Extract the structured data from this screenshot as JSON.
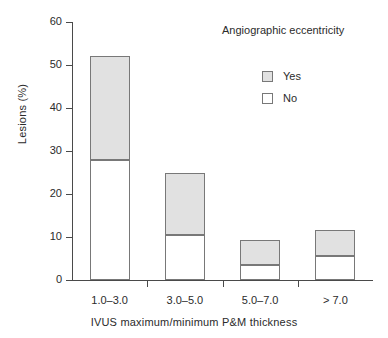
{
  "chart_data": {
    "type": "bar",
    "subtype": "stacked-vertical",
    "title": "",
    "xlabel": "IVUS maximum/minimum P&M thickness",
    "ylabel": "Lesions (%)",
    "categories": [
      "1.0–3.0",
      "3.0–5.0",
      "5.0–7.0",
      "> 7.0"
    ],
    "series": [
      {
        "name": "No",
        "values": [
          28.0,
          10.4,
          3.4,
          5.5
        ],
        "color": "#ffffff"
      },
      {
        "name": "Yes",
        "values": [
          24.0,
          14.6,
          6.0,
          6.1
        ],
        "color": "#e1e1e1"
      }
    ],
    "stack_totals": [
      52.0,
      25.0,
      9.4,
      11.6
    ],
    "ylim": [
      0,
      60
    ],
    "yticks": [
      0,
      10,
      20,
      30,
      40,
      50,
      60
    ],
    "ytick_labels": [
      "0",
      "10",
      "20",
      "30",
      "40",
      "50",
      "60"
    ],
    "grid": false,
    "legend": {
      "title": "Angiographic eccentricity",
      "position": "top-right",
      "entries": [
        {
          "label": "Yes",
          "color": "#e1e1e1"
        },
        {
          "label": "No",
          "color": "#ffffff"
        }
      ]
    },
    "axis_color": "#4a4a4a",
    "bar_edge_color": "#787878"
  }
}
